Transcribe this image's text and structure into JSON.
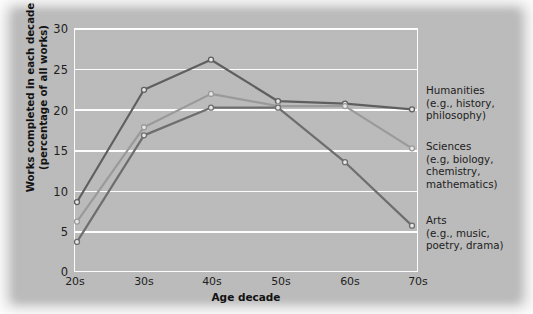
{
  "chart_data": {
    "type": "line",
    "title": "",
    "xlabel": "Age decade",
    "ylabel": "Works completed in each decade (percentage of all works)",
    "ylabel_line1": "Works completed in each decade",
    "ylabel_line2": "(percentage of all works)",
    "categories": [
      "20s",
      "30s",
      "40s",
      "50s",
      "60s",
      "70s"
    ],
    "ylim": [
      0,
      30
    ],
    "yticks": [
      0,
      5,
      10,
      15,
      20,
      25,
      30
    ],
    "ytick_labels": [
      "0",
      "5",
      "10",
      "15",
      "20",
      "25",
      "30"
    ],
    "grid": "horizontal-white",
    "legend_position": "right-inline-annotations",
    "series": [
      {
        "name": "Humanities",
        "annotation_title": "Humanities",
        "annotation_detail": "(e.g., history, philosophy)",
        "annotation_lines": [
          "Humanities",
          "(e.g., history,",
          "philosophy)"
        ],
        "color": "#5f5f5f",
        "values": [
          8.6,
          22.4,
          26.1,
          21.0,
          20.7,
          20.0
        ]
      },
      {
        "name": "Sciences",
        "annotation_title": "Sciences",
        "annotation_detail": "(e.g, biology, chemistry, mathematics)",
        "annotation_lines": [
          "Sciences",
          "(e.g, biology,",
          "chemistry,",
          "mathematics)"
        ],
        "color": "#9a9a9a",
        "values": [
          6.2,
          17.8,
          21.9,
          20.4,
          20.4,
          15.2
        ]
      },
      {
        "name": "Arts",
        "annotation_title": "Arts",
        "annotation_detail": "(e.g., music, poetry, drama)",
        "annotation_lines": [
          "Arts",
          "(e.g., music,",
          "poetry, drama)"
        ],
        "color": "#6e6e6e",
        "values": [
          3.7,
          16.8,
          20.2,
          20.2,
          13.5,
          5.7
        ]
      }
    ],
    "colors": {
      "background": "#bcbcbc",
      "gridline": "#ffffff",
      "axis_text": "#1d1d1d",
      "marker_fill": "#e8e8e8"
    }
  }
}
